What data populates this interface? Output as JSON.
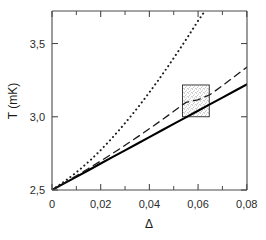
{
  "chart_data": {
    "type": "line",
    "title": "",
    "subtitle": "",
    "xlabel": "Δ",
    "ylabel": "T (mK)",
    "xlim": [
      0,
      0.0801
    ],
    "ylim": [
      2.5,
      3.722
    ],
    "grid": false,
    "legend": "none",
    "x_ticks": [
      0,
      0.02,
      0.04,
      0.06,
      0.08
    ],
    "x_tick_labels": [
      "0",
      "0,02",
      "0,04",
      "0,06",
      "0,08"
    ],
    "x_minor_ticks": [
      0.01,
      0.03,
      0.05,
      0.07
    ],
    "y_ticks": [
      2.5,
      3.0,
      3.5
    ],
    "y_tick_labels": [
      "2,5",
      "3,0",
      "3,5"
    ],
    "y_minor_ticks": [],
    "series": [
      {
        "name": "solid",
        "style": "solid",
        "color": "#000000",
        "width": 2.1,
        "points": [
          [
            0.0,
            2.5
          ],
          [
            0.005,
            2.545
          ],
          [
            0.01,
            2.59
          ],
          [
            0.015,
            2.635
          ],
          [
            0.02,
            2.681
          ],
          [
            0.025,
            2.726
          ],
          [
            0.03,
            2.771
          ],
          [
            0.035,
            2.816
          ],
          [
            0.04,
            2.861
          ],
          [
            0.045,
            2.906
          ],
          [
            0.05,
            2.951
          ],
          [
            0.055,
            2.996
          ],
          [
            0.06,
            3.041
          ],
          [
            0.065,
            3.086
          ],
          [
            0.07,
            3.131
          ],
          [
            0.075,
            3.176
          ],
          [
            0.08,
            3.221
          ]
        ]
      },
      {
        "name": "dashed",
        "style": "dashed",
        "color": "#1a1a1a",
        "width": 1.3,
        "points": [
          [
            0.0,
            2.5
          ],
          [
            0.005,
            2.548
          ],
          [
            0.01,
            2.597
          ],
          [
            0.015,
            2.647
          ],
          [
            0.02,
            2.698
          ],
          [
            0.025,
            2.751
          ],
          [
            0.03,
            2.805
          ],
          [
            0.035,
            2.861
          ],
          [
            0.04,
            2.918
          ],
          [
            0.045,
            2.977
          ],
          [
            0.05,
            3.037
          ],
          [
            0.055,
            3.098
          ],
          [
            0.06,
            3.116
          ],
          [
            0.065,
            3.152
          ],
          [
            0.07,
            3.212
          ],
          [
            0.075,
            3.275
          ],
          [
            0.08,
            3.338
          ]
        ]
      },
      {
        "name": "dotted",
        "style": "dotted",
        "color": "#1a1a1a",
        "width": 2.0,
        "points": [
          [
            0.0,
            2.5
          ],
          [
            0.004,
            2.545
          ],
          [
            0.008,
            2.594
          ],
          [
            0.012,
            2.648
          ],
          [
            0.016,
            2.707
          ],
          [
            0.02,
            2.772
          ],
          [
            0.024,
            2.842
          ],
          [
            0.028,
            2.917
          ],
          [
            0.032,
            2.996
          ],
          [
            0.036,
            3.079
          ],
          [
            0.04,
            3.166
          ],
          [
            0.044,
            3.257
          ],
          [
            0.048,
            3.352
          ],
          [
            0.052,
            3.45
          ],
          [
            0.056,
            3.551
          ],
          [
            0.06,
            3.655
          ],
          [
            0.0628,
            3.722
          ]
        ]
      }
    ],
    "annotations": [
      {
        "name": "stippled-region",
        "type": "shaded_box",
        "x0": 0.0536,
        "x1": 0.0646,
        "y0": 3.0,
        "y1": 3.217,
        "fill": "stipple",
        "edge_color": "#2b2b2b"
      }
    ]
  },
  "figure": {
    "axis_color": "#4a4a4a",
    "background": "#ffffff"
  }
}
